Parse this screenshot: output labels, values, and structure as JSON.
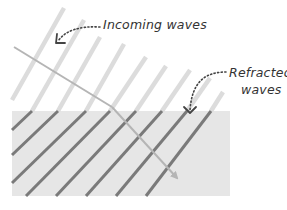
{
  "labels": {
    "incoming": "Incoming waves",
    "refracted_line1": "Refracted",
    "refracted_line2": "waves"
  },
  "colors": {
    "background": "#ffffff",
    "medium": "#e6e6e6",
    "incoming_wave": "#dcdcdc",
    "refracted_wave": "#7a7a7a",
    "ray": "#b5b5b5",
    "annotation": "#444444",
    "text": "#333333"
  },
  "medium": {
    "x": 12,
    "y": 111,
    "width": 218,
    "height": 85
  },
  "incoming_waves": [
    {
      "x1": 12,
      "y1": 100,
      "x2": 64,
      "y2": 8
    },
    {
      "x1": 32,
      "y1": 111,
      "x2": 84,
      "y2": 20
    },
    {
      "x1": 58,
      "y1": 111,
      "x2": 100,
      "y2": 37
    },
    {
      "x1": 86,
      "y1": 111,
      "x2": 124,
      "y2": 44
    },
    {
      "x1": 110,
      "y1": 111,
      "x2": 146,
      "y2": 57
    },
    {
      "x1": 136,
      "y1": 111,
      "x2": 166,
      "y2": 66
    },
    {
      "x1": 162,
      "y1": 111,
      "x2": 190,
      "y2": 70
    },
    {
      "x1": 187,
      "y1": 111,
      "x2": 210,
      "y2": 78
    },
    {
      "x1": 211,
      "y1": 111,
      "x2": 223,
      "y2": 92
    }
  ],
  "refracted_waves": [
    {
      "x1": 12,
      "y1": 130,
      "x2": 32,
      "y2": 111
    },
    {
      "x1": 12,
      "y1": 155,
      "x2": 58,
      "y2": 111
    },
    {
      "x1": 12,
      "y1": 183,
      "x2": 86,
      "y2": 111
    },
    {
      "x1": 26,
      "y1": 196,
      "x2": 110,
      "y2": 111
    },
    {
      "x1": 56,
      "y1": 196,
      "x2": 136,
      "y2": 111
    },
    {
      "x1": 86,
      "y1": 196,
      "x2": 162,
      "y2": 111
    },
    {
      "x1": 116,
      "y1": 196,
      "x2": 187,
      "y2": 111
    },
    {
      "x1": 146,
      "y1": 196,
      "x2": 211,
      "y2": 111
    }
  ],
  "ray": {
    "incoming": {
      "x1": 14,
      "y1": 47,
      "x2": 112,
      "y2": 107
    },
    "refracted": {
      "x1": 112,
      "y1": 107,
      "x2": 177,
      "y2": 178
    }
  },
  "annotations": {
    "incoming_arrow": "M 100 27 C 80 26, 66 30, 58 41",
    "refracted_arrow": "M 226 72 C 205 72, 192 82, 190 110"
  }
}
